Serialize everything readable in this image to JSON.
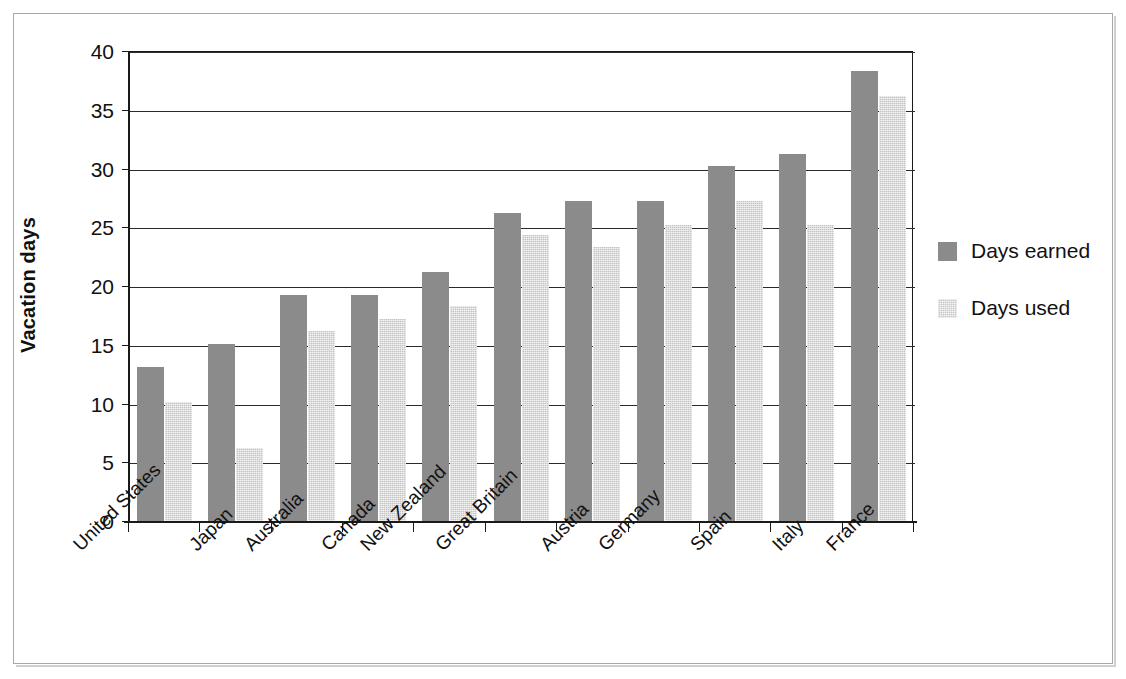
{
  "chart_data": {
    "type": "bar",
    "title": "",
    "xlabel": "",
    "ylabel": "Vacation days",
    "ylim": [
      0,
      40
    ],
    "yticks": [
      0,
      5,
      10,
      15,
      20,
      25,
      30,
      35,
      40
    ],
    "ytick_labels": [
      "0",
      "5",
      "10",
      "15",
      "20",
      "25",
      "30",
      "35",
      "40"
    ],
    "grid": "horizontal",
    "legend_position": "right",
    "categories": [
      "United States",
      "Japan",
      "Australia",
      "Canada",
      "New Zealand",
      "Great Britain",
      "Austria",
      "Germany",
      "Spain",
      "Italy",
      "France"
    ],
    "series": [
      {
        "name": "Days earned",
        "color": "#8b8b8b",
        "values": [
          13.1,
          15.1,
          19.2,
          19.2,
          21.2,
          26.2,
          27.2,
          27.2,
          30.2,
          31.2,
          38.3
        ]
      },
      {
        "name": "Days used",
        "color": "#c8c8c8",
        "values": [
          10.1,
          6.2,
          16.2,
          17.2,
          18.3,
          24.3,
          23.3,
          25.2,
          27.2,
          25.2,
          36.2
        ]
      }
    ]
  },
  "legend": {
    "entries": [
      {
        "label": "Days earned"
      },
      {
        "label": "Days used"
      }
    ]
  },
  "colors": {
    "days_earned": "#8b8b8b",
    "days_used": "#c8c8c8",
    "axis": "#1a1a1a",
    "grid": "#2b2b2b",
    "frame": "#a8a8ab",
    "background": "#ffffff"
  }
}
